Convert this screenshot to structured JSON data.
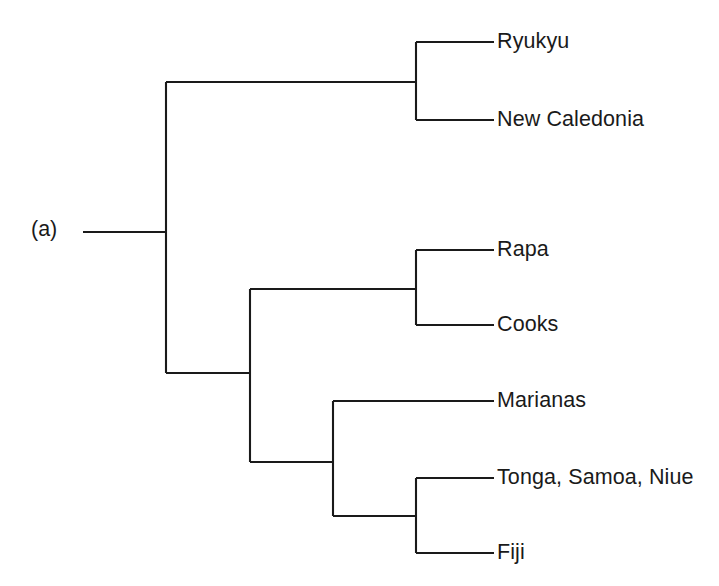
{
  "figure": {
    "panel_label": "(a)",
    "width": 719,
    "height": 586,
    "background_color": "#ffffff",
    "line_color": "#1a1a1a",
    "text_color": "#1a1a1a"
  },
  "chart_data": {
    "type": "diagram",
    "diagram_kind": "cladogram",
    "title": "(a)",
    "orientation": "left-to-right",
    "grid": false,
    "legend": false,
    "tips": [
      {
        "id": "ryukyu",
        "label": "Ryukyu",
        "x": 497,
        "y": 42
      },
      {
        "id": "new-caledonia",
        "label": "New Caledonia",
        "x": 497,
        "y": 120
      },
      {
        "id": "rapa",
        "label": "Rapa",
        "x": 497,
        "y": 250
      },
      {
        "id": "cooks",
        "label": "Cooks",
        "x": 497,
        "y": 325
      },
      {
        "id": "marianas",
        "label": "Marianas",
        "x": 497,
        "y": 401
      },
      {
        "id": "tonga-samoa-niue",
        "label": "Tonga, Samoa, Niue",
        "x": 497,
        "y": 478
      },
      {
        "id": "fiji",
        "label": "Fiji",
        "x": 497,
        "y": 553
      }
    ],
    "clades": [
      {
        "id": "root",
        "children": [
          "clade-ryukyu-newcaledonia",
          "clade-pacific"
        ],
        "node_x": 166
      },
      {
        "id": "clade-ryukyu-newcaledonia",
        "children": [
          "ryukyu",
          "new-caledonia"
        ],
        "node_x": 416
      },
      {
        "id": "clade-pacific",
        "children": [
          "clade-rapa-cooks",
          "clade-marianas-tonga-fiji"
        ],
        "node_x": 250
      },
      {
        "id": "clade-rapa-cooks",
        "children": [
          "rapa",
          "cooks"
        ],
        "node_x": 416
      },
      {
        "id": "clade-marianas-tonga-fiji",
        "children": [
          "marianas",
          "clade-tonga-fiji"
        ],
        "node_x": 333
      },
      {
        "id": "clade-tonga-fiji",
        "children": [
          "tonga-samoa-niue",
          "fiji"
        ],
        "node_x": 416
      }
    ],
    "segments": [
      {
        "name": "root-stem",
        "x1": 83,
        "y1": 232,
        "x2": 166,
        "y2": 232
      },
      {
        "name": "root-vertical",
        "x1": 166,
        "y1": 82,
        "x2": 166,
        "y2": 373
      },
      {
        "name": "branch-top-clade",
        "x1": 166,
        "y1": 82,
        "x2": 416,
        "y2": 82
      },
      {
        "name": "node-top-vertical",
        "x1": 416,
        "y1": 42,
        "x2": 416,
        "y2": 120
      },
      {
        "name": "tip-ryukyu",
        "x1": 416,
        "y1": 42,
        "x2": 494,
        "y2": 42
      },
      {
        "name": "tip-new-caledonia",
        "x1": 416,
        "y1": 120,
        "x2": 494,
        "y2": 120
      },
      {
        "name": "branch-pacific",
        "x1": 166,
        "y1": 373,
        "x2": 250,
        "y2": 373
      },
      {
        "name": "node-pacific-vertical",
        "x1": 250,
        "y1": 289,
        "x2": 250,
        "y2": 462
      },
      {
        "name": "branch-rapa-cooks",
        "x1": 250,
        "y1": 289,
        "x2": 416,
        "y2": 289
      },
      {
        "name": "node-rapa-vertical",
        "x1": 416,
        "y1": 250,
        "x2": 416,
        "y2": 325
      },
      {
        "name": "tip-rapa",
        "x1": 416,
        "y1": 250,
        "x2": 494,
        "y2": 250
      },
      {
        "name": "tip-cooks",
        "x1": 416,
        "y1": 325,
        "x2": 494,
        "y2": 325
      },
      {
        "name": "branch-marianas-grp",
        "x1": 250,
        "y1": 462,
        "x2": 333,
        "y2": 462
      },
      {
        "name": "node-marianas-vert",
        "x1": 333,
        "y1": 401,
        "x2": 333,
        "y2": 516
      },
      {
        "name": "tip-marianas",
        "x1": 333,
        "y1": 401,
        "x2": 494,
        "y2": 401
      },
      {
        "name": "branch-tonga-fiji",
        "x1": 333,
        "y1": 516,
        "x2": 416,
        "y2": 516
      },
      {
        "name": "node-tonga-vertical",
        "x1": 416,
        "y1": 478,
        "x2": 416,
        "y2": 553
      },
      {
        "name": "tip-tonga",
        "x1": 416,
        "y1": 478,
        "x2": 494,
        "y2": 478
      },
      {
        "name": "tip-fiji",
        "x1": 416,
        "y1": 553,
        "x2": 494,
        "y2": 553
      }
    ]
  }
}
